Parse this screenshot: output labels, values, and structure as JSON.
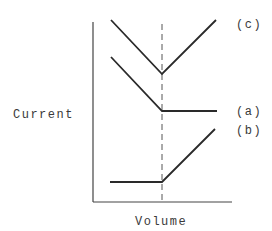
{
  "diagram": {
    "ylabel": "Current",
    "xlabel": "Volume",
    "endpoint_marker": "dashed vertical line at equivalence point",
    "curves": [
      {
        "id": "c",
        "label": "(c)",
        "shape": "decreasing then increasing (V-shape)"
      },
      {
        "id": "a",
        "label": "(a)",
        "shape": "decreasing then constant"
      },
      {
        "id": "b",
        "label": "(b)",
        "shape": "constant then increasing"
      }
    ]
  }
}
